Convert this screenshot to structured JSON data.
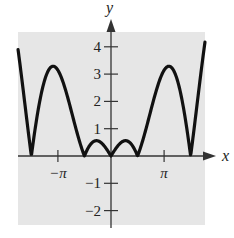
{
  "chart_data": {
    "type": "line",
    "title": "",
    "function": "y = |x cos x|",
    "xlabel": "x",
    "ylabel": "y",
    "xlim": [
      -5.5,
      5.56
    ],
    "ylim": [
      -2.4,
      4.55
    ],
    "x_ticks": [
      {
        "value": -3.14159,
        "label": "−π"
      },
      {
        "value": 3.14159,
        "label": "π"
      }
    ],
    "y_ticks": [
      {
        "value": 4,
        "label": "4"
      },
      {
        "value": 3,
        "label": "3"
      },
      {
        "value": 2,
        "label": "2"
      },
      {
        "value": 1,
        "label": "1"
      },
      {
        "value": -1,
        "label": "−1"
      },
      {
        "value": -2,
        "label": "−2"
      }
    ],
    "grid": false,
    "legend": null,
    "background_color": "#e6e6e6",
    "line_color": "#111111",
    "series": [
      {
        "name": "|x cos x|",
        "x": [
          -5.5,
          -5.0,
          -4.712,
          -4.5,
          -4.0,
          -3.5,
          -3.426,
          -3.0,
          -2.5,
          -2.0,
          -1.571,
          -1.2,
          -0.86,
          -0.5,
          0,
          0.5,
          0.86,
          1.2,
          1.571,
          2.0,
          2.5,
          3.0,
          3.426,
          3.5,
          4.0,
          4.5,
          4.712,
          5.0,
          5.56
        ],
        "values": [
          3.9,
          1.42,
          0.0,
          0.95,
          2.61,
          3.28,
          3.29,
          2.97,
          2.0,
          0.83,
          0.0,
          0.43,
          0.56,
          0.44,
          0.0,
          0.44,
          0.56,
          0.43,
          0.0,
          0.83,
          2.0,
          2.97,
          3.29,
          3.28,
          2.61,
          0.95,
          0.0,
          1.42,
          4.1
        ]
      }
    ]
  }
}
